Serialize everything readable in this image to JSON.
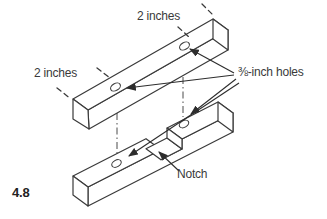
{
  "figure": {
    "number": "4.8",
    "labels": {
      "top_dimension": "2 inches",
      "left_dimension": "2 inches",
      "holes": "⅜-inch holes",
      "notch": "Notch"
    },
    "colors": {
      "line": "#3a3a3a",
      "text": "#3a3a3a",
      "background": "#ffffff"
    }
  }
}
